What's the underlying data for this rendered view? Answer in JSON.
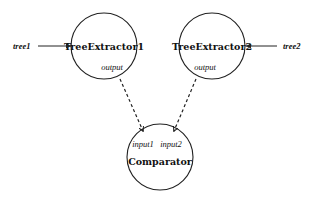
{
  "diagram": {
    "nodes": [
      {
        "id": "tree_extractor_1",
        "label": "TreeExtractor1",
        "ports": [
          {
            "label": "output"
          }
        ]
      },
      {
        "id": "tree_extractor_2",
        "label": "TreeExtractor2",
        "ports": [
          {
            "label": "output"
          }
        ]
      },
      {
        "id": "comparator",
        "label": "Comparator",
        "ports": [
          {
            "label": "input1"
          },
          {
            "label": "input2"
          }
        ]
      }
    ],
    "external_inputs": [
      {
        "label": "tree1",
        "target": "tree_extractor_1"
      },
      {
        "label": "tree2",
        "target": "tree_extractor_2"
      }
    ],
    "edges": [
      {
        "from": "tree_extractor_1.output",
        "to": "comparator.input1",
        "style": "dashed"
      },
      {
        "from": "tree_extractor_2.output",
        "to": "comparator.input2",
        "style": "dashed"
      }
    ]
  }
}
